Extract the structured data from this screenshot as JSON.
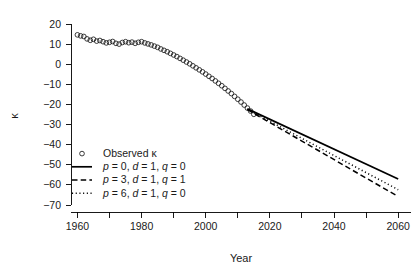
{
  "chart_data": {
    "type": "scatter",
    "title": "",
    "xlabel": "Year",
    "ylabel": "κ",
    "xlim": [
      1958,
      2064
    ],
    "ylim": [
      -72,
      22
    ],
    "xticks": [
      1960,
      1980,
      2000,
      2020,
      2040,
      2060
    ],
    "xtick_labels": [
      "1960",
      "1980",
      "2000",
      "2020",
      "2040",
      "2060"
    ],
    "xminor_ticks": [
      1970,
      1990,
      2010,
      2030,
      2050
    ],
    "yticks": [
      20,
      10,
      0,
      -10,
      -20,
      -30,
      -40,
      -50,
      -60,
      -70
    ],
    "ytick_labels": [
      "20",
      "10",
      "0",
      "−10",
      "−20",
      "−30",
      "−40",
      "−50",
      "−60",
      "−70"
    ],
    "grid": false,
    "legend_position": "bottom-left",
    "series": [
      {
        "name": "Observed κ",
        "type": "scatter",
        "marker": "open-circle",
        "color": "#1a1a1a",
        "x": [
          1960,
          1961,
          1962,
          1963,
          1964,
          1965,
          1966,
          1967,
          1968,
          1969,
          1970,
          1971,
          1972,
          1973,
          1974,
          1975,
          1976,
          1977,
          1978,
          1979,
          1980,
          1981,
          1982,
          1983,
          1984,
          1985,
          1986,
          1987,
          1988,
          1989,
          1990,
          1991,
          1992,
          1993,
          1994,
          1995,
          1996,
          1997,
          1998,
          1999,
          2000,
          2001,
          2002,
          2003,
          2004,
          2005,
          2006,
          2007,
          2008,
          2009,
          2010,
          2011,
          2012,
          2013,
          2014,
          2015
        ],
        "y": [
          14.6,
          14.1,
          13.8,
          12.6,
          11.9,
          12.4,
          11.5,
          11.8,
          11.2,
          10.6,
          10.9,
          11.3,
          10.4,
          10.0,
          10.8,
          11.2,
          10.7,
          11.0,
          10.4,
          10.9,
          11.2,
          10.6,
          10.1,
          9.6,
          9.0,
          8.4,
          7.6,
          6.9,
          6.2,
          5.4,
          4.6,
          3.8,
          2.9,
          2.0,
          1.1,
          0.2,
          -0.8,
          -1.8,
          -2.8,
          -3.8,
          -4.9,
          -6.0,
          -7.1,
          -8.3,
          -9.5,
          -10.7,
          -12.0,
          -13.3,
          -14.6,
          -16.0,
          -17.4,
          -18.8,
          -20.3,
          -21.8,
          -23.3,
          -24.9
        ]
      },
      {
        "name": "p = 0, d = 1, q = 0",
        "type": "line",
        "style": "solid",
        "color": "#000000",
        "legend_label_parts": {
          "p_var": "p",
          "p_val": " = 0,",
          "d_var": "d",
          "d_val": " = 1,",
          "q_var": "q",
          "q_val": " = 0"
        },
        "x": [
          2013,
          2060
        ],
        "y": [
          -22.2,
          -57.1
        ]
      },
      {
        "name": "p = 3, d = 1, q = 1",
        "type": "line",
        "style": "dashed",
        "color": "#000000",
        "legend_label_parts": {
          "p_var": "p",
          "p_val": " = 3,",
          "d_var": "d",
          "d_val": " = 1,",
          "q_var": "q",
          "q_val": " = 1"
        },
        "x": [
          2013,
          2060
        ],
        "y": [
          -22.6,
          -65.8
        ]
      },
      {
        "name": "p = 6, d = 1, q = 0",
        "type": "line",
        "style": "dotted",
        "color": "#000000",
        "legend_label_parts": {
          "p_var": "p",
          "p_val": " = 6,",
          "d_var": "d",
          "d_val": " = 1,",
          "q_var": "q",
          "q_val": " = 0"
        },
        "x": [
          2013,
          2060
        ],
        "y": [
          -22.4,
          -62.4
        ]
      }
    ],
    "legend_entries": [
      {
        "marker": "open-circle",
        "label": "Observed κ"
      },
      {
        "marker": "solid-line",
        "label": "p = 0, d = 1, q = 0"
      },
      {
        "marker": "dashed-line",
        "label": "p = 3, d = 1, q = 1"
      },
      {
        "marker": "dotted-line",
        "label": "p = 6, d = 1, q = 0"
      }
    ]
  }
}
